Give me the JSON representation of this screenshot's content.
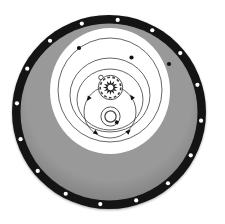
{
  "diagram": {
    "canvas": {
      "width": 225,
      "height": 224,
      "background": "#ffffff"
    },
    "colors": {
      "rim": "#141414",
      "face_center": "#999999",
      "face_edge": "#7d7d7d",
      "opening": "#ffffff",
      "line": "#3f3f3f",
      "marker": "#101010",
      "hole": "#ffffff"
    },
    "wheel": {
      "cx": 109,
      "cy": 112,
      "outer_radius": 97,
      "rim_inner_radius": 88.5
    },
    "bolt_holes": {
      "count": 16,
      "ring_radius": 92.5,
      "hole_radius": 2.1,
      "start_angle_deg": -84.6,
      "step_deg": 22.5
    },
    "opening": {
      "cx": 110,
      "cy": 91,
      "rx": 60,
      "ry": 63
    },
    "rings": [
      {
        "cx": 110,
        "cy": 90,
        "rx": 52,
        "ry": 52
      },
      {
        "cx": 110,
        "cy": 95,
        "rx": 40,
        "ry": 37
      },
      {
        "cx": 110,
        "cy": 99.5,
        "rx": 33,
        "ry": 30.5
      }
    ],
    "orbit": {
      "cx": 110,
      "cy": 112,
      "r": 26,
      "markers": [
        {
          "x": 88.7,
          "y": 98.3
        },
        {
          "x": 132.0,
          "y": 97.3
        },
        {
          "x": 95.7,
          "y": 132.7
        },
        {
          "x": 128.3,
          "y": 131.7
        }
      ],
      "marker_size": 3.2
    },
    "dots": [
      {
        "x": 79,
        "y": 48,
        "r": 2.1
      },
      {
        "x": 131.5,
        "y": 57.5,
        "r": 2.1
      },
      {
        "x": 169,
        "y": 64,
        "r": 2.1
      }
    ],
    "gear": {
      "cx": 110.5,
      "cy": 87.5,
      "outer_r": 12.2,
      "scallop_r": 10.3,
      "teeth": 12,
      "tooth_outer_r": 7.6,
      "tooth_inner_r": 3.9,
      "hub_r": 3.3,
      "notch": {
        "x": 101,
        "y": 77.5,
        "r": 2.3
      }
    },
    "hub": {
      "cx": 110.5,
      "cy": 116.5,
      "outer_r": 9.6,
      "inner_r": 5.6,
      "key": {
        "x": 116.8,
        "y": 122.3,
        "size": 3.4,
        "angle_deg": 20
      }
    }
  }
}
